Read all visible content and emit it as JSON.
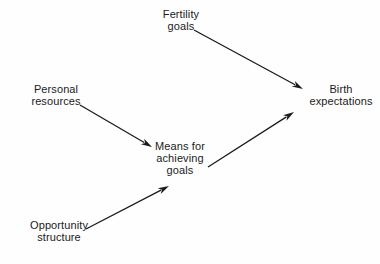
{
  "diagram": {
    "type": "path-diagram",
    "background_color": "#fefefe",
    "text_color": "#1b1b1b",
    "arrow_color": "#1b1b1b",
    "canvas": {
      "width": 380,
      "height": 264
    },
    "nodes": [
      {
        "id": "fertility-goals",
        "name": "node-fertility-goals",
        "lines": [
          "Fertility",
          "goals"
        ],
        "text": "Fertility goals",
        "x": 148,
        "y": 8,
        "width": 66,
        "align": "center"
      },
      {
        "id": "personal-resources",
        "name": "node-personal-resources",
        "lines": [
          "Personal",
          "resources"
        ],
        "text": "Personal resources",
        "x": 18,
        "y": 83,
        "width": 76,
        "align": "center"
      },
      {
        "id": "birth-expectations",
        "name": "node-birth-expectations",
        "lines": [
          "Birth",
          "expectations"
        ],
        "text": "Birth expectations",
        "x": 303,
        "y": 83,
        "width": 76,
        "align": "center"
      },
      {
        "id": "means-for-achieving-goals",
        "name": "node-means-for-achieving-goals",
        "lines": [
          "Means for",
          "achieving",
          "goals"
        ],
        "text": "Means for achieving goals",
        "x": 150,
        "y": 140,
        "width": 60,
        "align": "center"
      },
      {
        "id": "opportunity-structure",
        "name": "node-opportunity-structure",
        "lines": [
          "Opportunity",
          "structure"
        ],
        "text": "Opportunity structure",
        "x": 18,
        "y": 219,
        "width": 82,
        "align": "center"
      }
    ],
    "arrows": [
      {
        "id": "fertility-to-birth",
        "name": "arrow-fertility-goals-to-birth-expectations",
        "from": "fertility-goals",
        "to": "birth-expectations",
        "x1": 194,
        "y1": 30,
        "x2": 303,
        "y2": 89
      },
      {
        "id": "personal-to-means",
        "name": "arrow-personal-resources-to-means",
        "from": "personal-resources",
        "to": "means-for-achieving-goals",
        "x1": 80,
        "y1": 105,
        "x2": 152,
        "y2": 147
      },
      {
        "id": "means-to-birth",
        "name": "arrow-means-to-birth-expectations",
        "from": "means-for-achieving-goals",
        "to": "birth-expectations",
        "x1": 208,
        "y1": 167,
        "x2": 294,
        "y2": 112
      },
      {
        "id": "opportunity-to-means",
        "name": "arrow-opportunity-structure-to-means",
        "from": "opportunity-structure",
        "to": "means-for-achieving-goals",
        "x1": 86,
        "y1": 229,
        "x2": 169,
        "y2": 186
      }
    ],
    "style": {
      "line_width": 1.3,
      "arrowhead_length": 11,
      "arrowhead_width": 6.5,
      "font_size_px": 11
    }
  }
}
